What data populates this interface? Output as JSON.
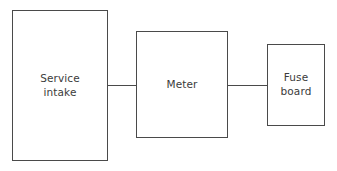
{
  "diagram": {
    "background_color": "#ffffff",
    "stroke_color": "#4a4a4a",
    "text_color": "#3b3b3b",
    "nodes": [
      {
        "id": "service-intake",
        "label": "Service\nintake"
      },
      {
        "id": "meter",
        "label": "Meter"
      },
      {
        "id": "fuse-board",
        "label": "Fuse\nboard"
      }
    ],
    "connectors": [
      {
        "id": "intake-meter",
        "from": "service-intake",
        "to": "meter",
        "style": "plain-line"
      },
      {
        "id": "meter-fuse",
        "from": "meter",
        "to": "fuse-board",
        "style": "plain-line"
      }
    ]
  }
}
